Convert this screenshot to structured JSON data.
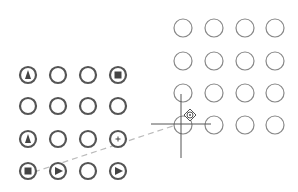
{
  "colors": {
    "background": "#ffffff",
    "left_circle_stroke": "#555555",
    "right_circle_stroke": "#888888",
    "glyph_fill": "#444444",
    "crosshair": "#555555",
    "drag_path": "#bbbbbb"
  },
  "left_grid": {
    "cols": [
      28,
      58,
      88,
      118
    ],
    "rows": [
      75,
      106,
      139,
      171
    ],
    "radius": 8,
    "cells": [
      [
        "triangle-icon",
        "empty",
        "empty",
        "square-icon"
      ],
      [
        "empty",
        "empty",
        "empty",
        "empty"
      ],
      [
        "triangle-icon",
        "empty",
        "empty",
        "plus-icon"
      ],
      [
        "square-icon",
        "play-icon",
        "empty",
        "play-icon"
      ]
    ]
  },
  "right_grid": {
    "cols": [
      183,
      214,
      245,
      275
    ],
    "rows": [
      28,
      61,
      93,
      125
    ],
    "radius": 9
  },
  "cursor": {
    "x": 181,
    "y": 124,
    "move_icon": {
      "x": 190,
      "y": 115
    }
  },
  "drag_path": {
    "from": [
      34,
      172
    ],
    "to": [
      176,
      125
    ]
  }
}
